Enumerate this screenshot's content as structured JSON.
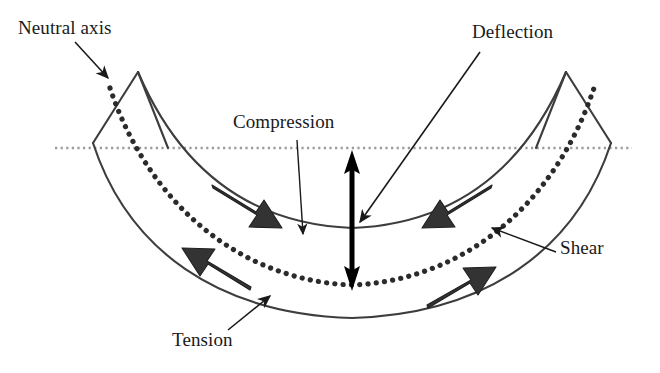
{
  "labels": {
    "neutral_axis": "Neutral axis",
    "compression": "Compression",
    "deflection": "Deflection",
    "shear": "Shear",
    "tension": "Tension"
  },
  "colors": {
    "ink": "#1a1a1a",
    "beam_outline": "#3d3d3d",
    "neutral_axis_dots": "#2b2b2b",
    "reference_axis": "#9a9a9a",
    "block_arrow_fill": "#333333",
    "background": "#ffffff"
  },
  "geometry": {
    "reference_axis_y": 148,
    "reference_axis_x_start": 55,
    "reference_axis_x_end": 632,
    "deflection_arrow_x": 352,
    "deflection_arrow_top_y": 152,
    "deflection_arrow_bottom_y": 288
  },
  "annotations": [
    {
      "name": "neutral-axis",
      "label": "Neutral axis",
      "points_to": "dotted mid-depth curve at left end"
    },
    {
      "name": "compression",
      "label": "Compression",
      "points_to": "upper beam fiber at mid-span"
    },
    {
      "name": "deflection",
      "label": "Deflection",
      "points_to": "vertical double arrow at mid-span"
    },
    {
      "name": "shear",
      "label": "Shear",
      "points_to": "neutral axis on right half"
    },
    {
      "name": "tension",
      "label": "Tension",
      "points_to": "lower beam fiber at left of mid-span"
    }
  ],
  "force_arrows": [
    {
      "name": "compression-arrow-left",
      "region": "compression",
      "direction": "inward-right"
    },
    {
      "name": "compression-arrow-right",
      "region": "compression",
      "direction": "inward-left"
    },
    {
      "name": "tension-arrow-left",
      "region": "tension",
      "direction": "outward-left"
    },
    {
      "name": "tension-arrow-right",
      "region": "tension",
      "direction": "outward-right"
    }
  ]
}
